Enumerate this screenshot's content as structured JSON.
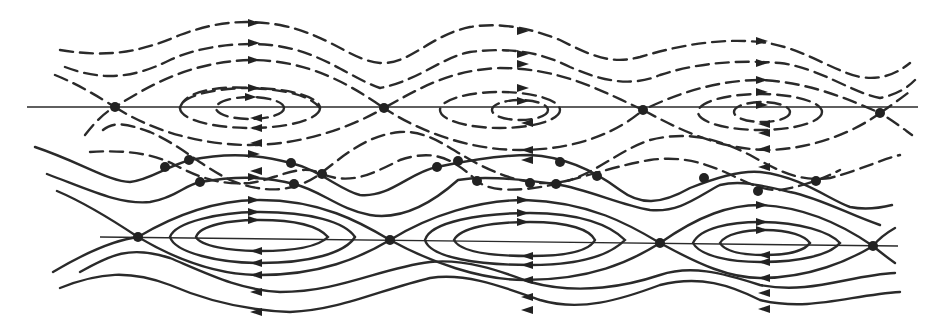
{
  "figure": {
    "colors": {
      "stroke": "#2a2a2a",
      "background": "#ffffff"
    },
    "top_chain": {
      "style": "dashed",
      "axis": {
        "y": 107,
        "x1": 27,
        "x2": 918
      },
      "saddles": [
        [
          115,
          107
        ],
        [
          384,
          108
        ],
        [
          643,
          110
        ],
        [
          880,
          113
        ]
      ],
      "centers": [
        [
          250,
          108
        ],
        [
          520,
          110
        ],
        [
          762,
          112
        ]
      ],
      "flow_above": "right",
      "flow_below": "left"
    },
    "bottom_chain": {
      "style": "solid",
      "axis": {
        "y": 238,
        "x1": 100,
        "x2": 898
      },
      "saddles": [
        [
          138,
          237
        ],
        [
          390,
          240
        ],
        [
          660,
          243
        ],
        [
          873,
          246
        ]
      ],
      "centers": [
        [
          260,
          238
        ],
        [
          525,
          242
        ],
        [
          760,
          245
        ]
      ],
      "flow_above": "right",
      "flow_below": "left"
    },
    "intersection_points": [
      [
        165,
        167
      ],
      [
        189,
        160
      ],
      [
        200,
        182
      ],
      [
        291,
        163
      ],
      [
        294,
        184
      ],
      [
        322,
        174
      ],
      [
        437,
        167
      ],
      [
        458,
        161
      ],
      [
        477,
        181
      ],
      [
        530,
        183
      ],
      [
        560,
        162
      ],
      [
        556,
        184
      ],
      [
        597,
        176
      ],
      [
        704,
        178
      ],
      [
        758,
        191
      ],
      [
        816,
        181
      ]
    ]
  }
}
